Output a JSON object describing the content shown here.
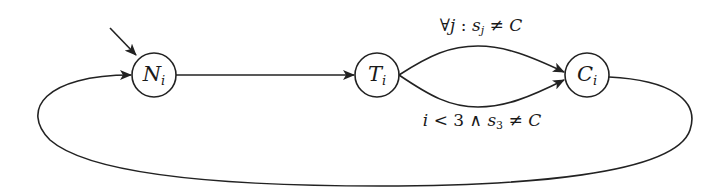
{
  "diagram": {
    "type": "state-machine",
    "stroke_color": "#222222",
    "background": "#ffffff",
    "states": [
      {
        "id": "N",
        "label": "N",
        "subscript": "i",
        "initial": true
      },
      {
        "id": "T",
        "label": "T",
        "subscript": "i",
        "initial": false
      },
      {
        "id": "C",
        "label": "C",
        "subscript": "i",
        "initial": false
      }
    ],
    "transitions": [
      {
        "from": "N",
        "to": "T",
        "label": ""
      },
      {
        "from": "T",
        "to": "C",
        "label": "∀j : s_j ≠ C",
        "position": "upper"
      },
      {
        "from": "T",
        "to": "C",
        "label": "i < 3 ∧ s_3 ≠ C",
        "position": "lower"
      },
      {
        "from": "C",
        "to": "N",
        "label": "",
        "position": "loop-below"
      }
    ],
    "labels": {
      "state_n": {
        "main": "N",
        "sub": "i"
      },
      "state_t": {
        "main": "T",
        "sub": "i"
      },
      "state_c": {
        "main": "C",
        "sub": "i"
      },
      "upper_edge": {
        "forall": "∀",
        "var": "j",
        "colon": " : ",
        "s": "s",
        "s_sub": "j",
        "neq": " ≠ ",
        "target": "C"
      },
      "lower_edge": {
        "var": "i",
        "lt": " < 3 ∧ ",
        "s": "s",
        "s_sub": "3",
        "neq": " ≠ ",
        "target": "C"
      }
    }
  }
}
